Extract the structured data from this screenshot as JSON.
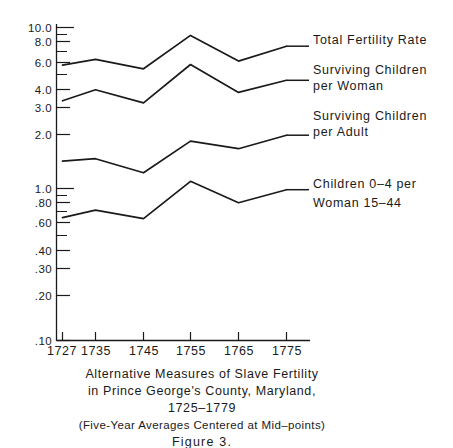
{
  "figure": {
    "number_label": "Figure  3.",
    "caption_lines": [
      "Alternative  Measures of  Slave  Fertility",
      "in Prince George's  County, Maryland,",
      "1725–1779"
    ],
    "caption_note": "(Five-Year Averages Centered at Mid–points)"
  },
  "chart_data": {
    "type": "line",
    "subtitle": "(Five-Year Averages Centered at Mid-points)",
    "xlabel": "",
    "ylabel": "",
    "yscale": "log",
    "ylim": [
      0.1,
      11.0
    ],
    "xlim": [
      1723,
      1781
    ],
    "grid": false,
    "legend_position": "right-inline",
    "x": [
      1727,
      1735,
      1745,
      1755,
      1765,
      1775
    ],
    "xtick_labels": [
      "1727",
      "1735",
      "1745",
      "1755",
      "1765",
      "1775"
    ],
    "ytick_labels": [
      "10.0",
      "8.0",
      "6.0",
      "4.0",
      "3.0",
      "2.0",
      "1.0",
      ".80",
      ".60",
      ".40",
      ".30",
      ".20",
      ".10"
    ],
    "ytick_values": [
      10.0,
      8.0,
      6.0,
      4.0,
      3.0,
      2.0,
      1.0,
      0.8,
      0.6,
      0.4,
      0.3,
      0.2,
      0.1
    ],
    "yminor_values": [
      9.0,
      7.0,
      5.0,
      0.9,
      0.7,
      0.5
    ],
    "series": [
      {
        "name": "Total Fertility Rate",
        "label_lines": [
          "Total Fertility Rate"
        ],
        "values": [
          5.75,
          6.25,
          5.45,
          8.9,
          6.1,
          7.6
        ]
      },
      {
        "name": "Surviving Children per Woman",
        "label_lines": [
          "Surviving Children",
          "per Woman"
        ],
        "values": [
          3.4,
          4.0,
          3.3,
          5.8,
          3.85,
          4.6
        ]
      },
      {
        "name": "Surviving Children per Adult",
        "label_lines": [
          "Surviving Children",
          "per Adult"
        ],
        "values": [
          1.4,
          1.45,
          1.18,
          1.88,
          1.68,
          2.05
        ]
      },
      {
        "name": "Children 0-4 per Woman 15-44",
        "label_lines": [
          "Children  0–4 per",
          "Woman  15–44"
        ],
        "values": [
          0.61,
          0.68,
          0.6,
          1.04,
          0.76,
          0.92
        ]
      }
    ]
  },
  "colors": {
    "ink": "#1a1a1a",
    "background": "#ffffff"
  }
}
